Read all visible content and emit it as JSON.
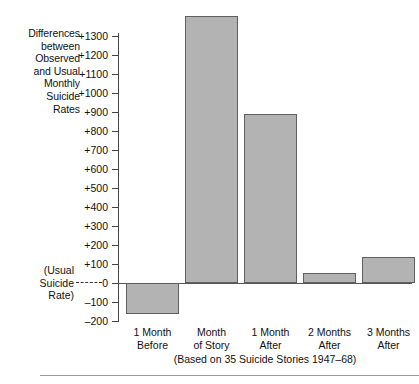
{
  "chart_data": {
    "type": "bar",
    "title": "",
    "ylabel": "Differences between Observed and Usual Monthly Suicide Rates",
    "xlabel": "",
    "categories": [
      "1 Month Before",
      "Month of Story",
      "1 Month After",
      "2 Months After",
      "3 Months After"
    ],
    "values": [
      -165,
      1405,
      890,
      55,
      135
    ],
    "ylim": [
      -200,
      1300
    ],
    "ytick_step": 100,
    "ytick_labels": [
      "+1300",
      "+1200",
      "+1100",
      "+1000",
      "+900",
      "+800",
      "+700",
      "+600",
      "+500",
      "+400",
      "+300",
      "+200",
      "+100",
      "0",
      "–100",
      "–200"
    ],
    "ytick_values": [
      1300,
      1200,
      1100,
      1000,
      900,
      800,
      700,
      600,
      500,
      400,
      300,
      200,
      100,
      0,
      -100,
      -200
    ],
    "grid": false,
    "legend": "none",
    "annotations": [
      "(Usual Suicide Rate)"
    ],
    "caption": "(Based on 35 Suicide Stories 1947–68)",
    "bar_fill_color": "#b3b3b3",
    "bar_border_color": "#606060",
    "axis_color": "#444444",
    "text_color": "#111111"
  },
  "axis_title": {
    "lines": [
      "Differences",
      "between",
      "Observed",
      "and Usual",
      "Monthly",
      "Suicide",
      "Rates"
    ]
  },
  "zero_reference": {
    "lines": [
      "(Usual",
      "Suicide",
      "Rate)"
    ]
  },
  "category_labels": [
    {
      "line1": "1 Month",
      "line2": "Before"
    },
    {
      "line1": "Month",
      "line2": "of Story"
    },
    {
      "line1": "1 Month",
      "line2": "After"
    },
    {
      "line1": "2 Months",
      "line2": "After"
    },
    {
      "line1": "3 Months",
      "line2": "After"
    }
  ],
  "caption": "(Based on 35 Suicide Stories 1947–68)"
}
